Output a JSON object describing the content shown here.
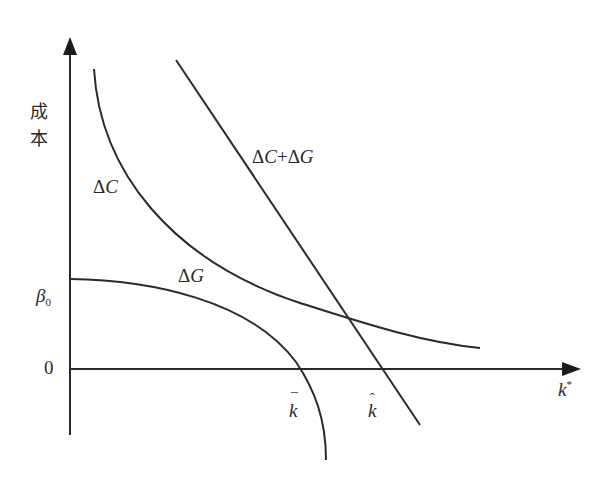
{
  "diagram": {
    "type": "cost-curve diagram",
    "y_axis": {
      "label": "成本",
      "ticks": [
        {
          "label": "β",
          "subscript": "0",
          "meaning": "ΔG intercept"
        },
        {
          "label": "0",
          "meaning": "origin"
        }
      ]
    },
    "x_axis": {
      "label": "k",
      "superscript": "*",
      "ticks": [
        {
          "label": "k",
          "accent": "¯",
          "meaning": "ΔG crosses zero"
        },
        {
          "label": "k",
          "accent": "ˆ",
          "meaning": "ΔC+ΔG crosses zero"
        }
      ]
    },
    "curves": [
      {
        "name": "ΔC",
        "shape": "convex, decreasing",
        "label_parts": [
          "Δ",
          "C"
        ]
      },
      {
        "name": "ΔG",
        "shape": "concave, decreasing from β0, crosses axis at k-bar",
        "label_parts": [
          "Δ",
          "G"
        ]
      },
      {
        "name": "ΔC+ΔG",
        "shape": "straight decreasing line, crosses axis at k-hat",
        "label_parts": [
          "Δ",
          "C",
          "+",
          "Δ",
          "G"
        ]
      }
    ],
    "colors": {
      "line": "#2a2a2a",
      "background": "#ffffff"
    }
  },
  "labels": {
    "y_axis_char1": "成",
    "y_axis_char2": "本",
    "beta": "β",
    "beta_sub": "0",
    "zero": "0",
    "kbar_base": "k",
    "kbar_mark": "¯",
    "khat_base": "k",
    "khat_mark": "ˆ",
    "kstar_base": "k",
    "kstar_sup": "*",
    "dc_delta": "Δ",
    "dc_var": "C",
    "dg_delta": "Δ",
    "dg_var": "G",
    "sum_delta1": "Δ",
    "sum_var1": "C",
    "sum_plus": "+",
    "sum_delta2": "Δ",
    "sum_var2": "G"
  }
}
